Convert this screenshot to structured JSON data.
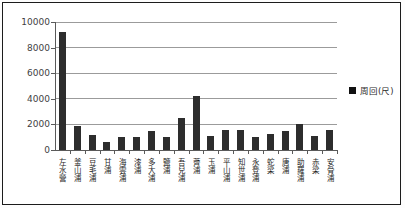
{
  "window": {
    "background": "#ffffff",
    "frame_border_color": "#1c1c1c"
  },
  "legend": {
    "marker_icon": "black-square-icon",
    "marker_color": "#111111",
    "label": "周回(尺)"
  },
  "chart_data": {
    "type": "bar",
    "title": "",
    "xlabel": "",
    "ylabel": "",
    "categories": [
      "左水營",
      "釜山浦",
      "豆毛浦",
      "甘浦",
      "海雲浦",
      "漆浦",
      "多大浦",
      "鹽浦",
      "吾兒浦",
      "薺浦",
      "玉浦",
      "平山浦",
      "知世浦",
      "永登浦",
      "蛇梁",
      "唐浦",
      "助羅浦",
      "赤梁",
      "安骨浦"
    ],
    "series": [
      {
        "name": "周回(尺)",
        "values": [
          9200,
          1900,
          1200,
          650,
          1000,
          1050,
          1500,
          1000,
          2500,
          4200,
          1100,
          1550,
          1600,
          1050,
          1250,
          1450,
          2000,
          1100,
          1600
        ]
      }
    ],
    "ylim": [
      0,
      10000
    ],
    "yticks": [
      0,
      2000,
      4000,
      6000,
      8000,
      10000
    ],
    "grid": true,
    "legend_position": "right",
    "bar_color": "#2d2d2d",
    "gridline_color": "#9b9b9b"
  }
}
